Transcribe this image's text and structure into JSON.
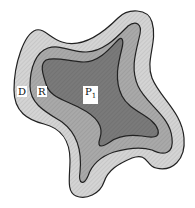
{
  "figure": {
    "type": "nested-region-diagram",
    "regions": [
      {
        "id": "D",
        "label": "D",
        "description": "outer region",
        "fill": "#d4d4d4"
      },
      {
        "id": "R",
        "label": "R",
        "description": "middle region",
        "fill": "#a9a9a9"
      },
      {
        "id": "P1",
        "label": "P",
        "subscript": "1",
        "description": "inner region",
        "fill": "#7a7a7a"
      }
    ],
    "stroke_color": "#222222",
    "background": "#ffffff"
  },
  "labels": {
    "d": "D",
    "r": "R",
    "p_main": "P",
    "p_sub": "1"
  }
}
